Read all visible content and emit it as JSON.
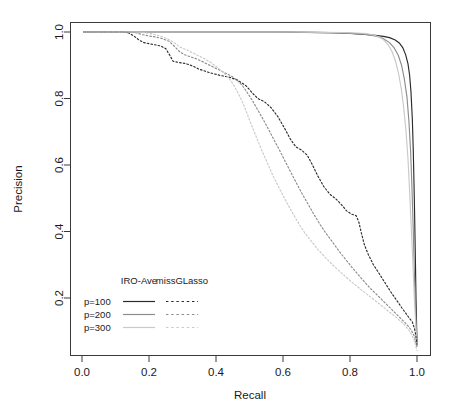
{
  "chart_data": {
    "type": "line",
    "title": "",
    "xlabel": "Recall",
    "ylabel": "Precision",
    "xlim": [
      0.0,
      1.0
    ],
    "ylim": [
      0.0,
      1.02
    ],
    "xticks": [
      "0.0",
      "0.2",
      "0.4",
      "0.6",
      "0.8",
      "1.0"
    ],
    "xtick_values": [
      0.0,
      0.2,
      0.4,
      0.6,
      0.8,
      1.0
    ],
    "yticks": [
      "0.2",
      "0.4",
      "0.6",
      "0.8",
      "1.0"
    ],
    "ytick_values": [
      0.2,
      0.4,
      0.6,
      0.8,
      1.0
    ],
    "grid": false,
    "legend_position": "lower-left-inside",
    "legend": {
      "col_headers": [
        "IRO-Ave",
        "missGLasso"
      ],
      "row_labels": [
        "p=100",
        "p=200",
        "p=300"
      ],
      "line_styles": {
        "IRO-Ave": "solid",
        "missGLasso": "dashed"
      },
      "row_colors": [
        "#2b2b2b",
        "#8c8c8c",
        "#c9c9c9"
      ]
    },
    "series": [
      {
        "name": "IRO-Ave p=100",
        "method": "IRO-Ave",
        "p": 100,
        "style": "solid",
        "color": "#2b2b2b",
        "points": [
          [
            0.005,
            1.0
          ],
          [
            0.1,
            1.0
          ],
          [
            0.2,
            1.0
          ],
          [
            0.3,
            1.0
          ],
          [
            0.4,
            1.0
          ],
          [
            0.5,
            1.0
          ],
          [
            0.6,
            1.0
          ],
          [
            0.68,
            0.999
          ],
          [
            0.74,
            0.998
          ],
          [
            0.8,
            0.996
          ],
          [
            0.845,
            0.993
          ],
          [
            0.875,
            0.99
          ],
          [
            0.9,
            0.987
          ],
          [
            0.918,
            0.983
          ],
          [
            0.935,
            0.976
          ],
          [
            0.948,
            0.966
          ],
          [
            0.958,
            0.952
          ],
          [
            0.966,
            0.932
          ],
          [
            0.973,
            0.905
          ],
          [
            0.978,
            0.87
          ],
          [
            0.982,
            0.82
          ],
          [
            0.986,
            0.74
          ],
          [
            0.989,
            0.64
          ],
          [
            0.992,
            0.5
          ],
          [
            0.995,
            0.33
          ],
          [
            0.997,
            0.2
          ],
          [
            0.999,
            0.11
          ],
          [
            1.0,
            0.065
          ]
        ]
      },
      {
        "name": "IRO-Ave p=200",
        "method": "IRO-Ave",
        "p": 200,
        "style": "solid",
        "color": "#8c8c8c",
        "points": [
          [
            0.005,
            1.0
          ],
          [
            0.15,
            1.0
          ],
          [
            0.3,
            1.0
          ],
          [
            0.45,
            1.0
          ],
          [
            0.58,
            1.0
          ],
          [
            0.66,
            0.999
          ],
          [
            0.72,
            0.998
          ],
          [
            0.78,
            0.997
          ],
          [
            0.82,
            0.995
          ],
          [
            0.855,
            0.992
          ],
          [
            0.88,
            0.987
          ],
          [
            0.9,
            0.98
          ],
          [
            0.918,
            0.968
          ],
          [
            0.932,
            0.952
          ],
          [
            0.944,
            0.93
          ],
          [
            0.954,
            0.9
          ],
          [
            0.962,
            0.86
          ],
          [
            0.97,
            0.805
          ],
          [
            0.976,
            0.73
          ],
          [
            0.981,
            0.64
          ],
          [
            0.985,
            0.53
          ],
          [
            0.989,
            0.4
          ],
          [
            0.992,
            0.28
          ],
          [
            0.995,
            0.18
          ],
          [
            0.998,
            0.11
          ],
          [
            1.0,
            0.065
          ]
        ]
      },
      {
        "name": "IRO-Ave p=300",
        "method": "IRO-Ave",
        "p": 300,
        "style": "solid",
        "color": "#c9c9c9",
        "points": [
          [
            0.005,
            1.0
          ],
          [
            0.2,
            1.0
          ],
          [
            0.4,
            1.0
          ],
          [
            0.55,
            1.0
          ],
          [
            0.65,
            1.0
          ],
          [
            0.72,
            0.999
          ],
          [
            0.78,
            0.998
          ],
          [
            0.82,
            0.997
          ],
          [
            0.85,
            0.995
          ],
          [
            0.87,
            0.991
          ],
          [
            0.888,
            0.985
          ],
          [
            0.902,
            0.975
          ],
          [
            0.915,
            0.96
          ],
          [
            0.926,
            0.94
          ],
          [
            0.936,
            0.912
          ],
          [
            0.945,
            0.875
          ],
          [
            0.953,
            0.83
          ],
          [
            0.96,
            0.775
          ],
          [
            0.967,
            0.705
          ],
          [
            0.973,
            0.62
          ],
          [
            0.978,
            0.52
          ],
          [
            0.983,
            0.41
          ],
          [
            0.988,
            0.3
          ],
          [
            0.992,
            0.2
          ],
          [
            0.996,
            0.125
          ],
          [
            1.0,
            0.055
          ]
        ]
      },
      {
        "name": "missGLasso p=100",
        "method": "missGLasso",
        "p": 100,
        "style": "dashed",
        "color": "#2b2b2b",
        "points": [
          [
            0.005,
            1.0
          ],
          [
            0.08,
            1.0
          ],
          [
            0.125,
            1.0
          ],
          [
            0.14,
            0.997
          ],
          [
            0.155,
            0.988
          ],
          [
            0.17,
            0.976
          ],
          [
            0.185,
            0.968
          ],
          [
            0.2,
            0.965
          ],
          [
            0.215,
            0.962
          ],
          [
            0.235,
            0.958
          ],
          [
            0.25,
            0.95
          ],
          [
            0.262,
            0.93
          ],
          [
            0.272,
            0.912
          ],
          [
            0.29,
            0.908
          ],
          [
            0.31,
            0.905
          ],
          [
            0.33,
            0.898
          ],
          [
            0.35,
            0.888
          ],
          [
            0.38,
            0.878
          ],
          [
            0.41,
            0.87
          ],
          [
            0.44,
            0.864
          ],
          [
            0.465,
            0.855
          ],
          [
            0.49,
            0.838
          ],
          [
            0.51,
            0.815
          ],
          [
            0.525,
            0.8
          ],
          [
            0.545,
            0.79
          ],
          [
            0.565,
            0.772
          ],
          [
            0.585,
            0.745
          ],
          [
            0.605,
            0.71
          ],
          [
            0.622,
            0.678
          ],
          [
            0.638,
            0.655
          ],
          [
            0.655,
            0.645
          ],
          [
            0.672,
            0.63
          ],
          [
            0.688,
            0.6
          ],
          [
            0.705,
            0.565
          ],
          [
            0.722,
            0.535
          ],
          [
            0.74,
            0.512
          ],
          [
            0.758,
            0.498
          ],
          [
            0.775,
            0.48
          ],
          [
            0.79,
            0.462
          ],
          [
            0.805,
            0.452
          ],
          [
            0.818,
            0.448
          ],
          [
            0.826,
            0.43
          ],
          [
            0.834,
            0.395
          ],
          [
            0.843,
            0.36
          ],
          [
            0.855,
            0.33
          ],
          [
            0.87,
            0.3
          ],
          [
            0.888,
            0.272
          ],
          [
            0.905,
            0.245
          ],
          [
            0.922,
            0.218
          ],
          [
            0.94,
            0.192
          ],
          [
            0.955,
            0.17
          ],
          [
            0.968,
            0.152
          ],
          [
            0.978,
            0.138
          ],
          [
            0.986,
            0.128
          ],
          [
            0.992,
            0.11
          ],
          [
            0.996,
            0.09
          ],
          [
            1.0,
            0.06
          ]
        ]
      },
      {
        "name": "missGLasso p=200",
        "method": "missGLasso",
        "p": 200,
        "style": "dashed",
        "color": "#8c8c8c",
        "points": [
          [
            0.005,
            1.0
          ],
          [
            0.1,
            1.0
          ],
          [
            0.14,
            1.0
          ],
          [
            0.16,
            0.998
          ],
          [
            0.18,
            0.992
          ],
          [
            0.2,
            0.988
          ],
          [
            0.22,
            0.985
          ],
          [
            0.24,
            0.98
          ],
          [
            0.26,
            0.972
          ],
          [
            0.275,
            0.958
          ],
          [
            0.29,
            0.942
          ],
          [
            0.305,
            0.932
          ],
          [
            0.325,
            0.925
          ],
          [
            0.345,
            0.918
          ],
          [
            0.365,
            0.908
          ],
          [
            0.385,
            0.898
          ],
          [
            0.405,
            0.888
          ],
          [
            0.425,
            0.878
          ],
          [
            0.445,
            0.868
          ],
          [
            0.462,
            0.856
          ],
          [
            0.478,
            0.84
          ],
          [
            0.492,
            0.82
          ],
          [
            0.508,
            0.795
          ],
          [
            0.525,
            0.765
          ],
          [
            0.542,
            0.735
          ],
          [
            0.558,
            0.705
          ],
          [
            0.575,
            0.672
          ],
          [
            0.592,
            0.64
          ],
          [
            0.608,
            0.608
          ],
          [
            0.625,
            0.575
          ],
          [
            0.642,
            0.542
          ],
          [
            0.658,
            0.512
          ],
          [
            0.675,
            0.482
          ],
          [
            0.692,
            0.452
          ],
          [
            0.71,
            0.422
          ],
          [
            0.728,
            0.395
          ],
          [
            0.748,
            0.368
          ],
          [
            0.768,
            0.34
          ],
          [
            0.79,
            0.312
          ],
          [
            0.812,
            0.285
          ],
          [
            0.835,
            0.258
          ],
          [
            0.858,
            0.232
          ],
          [
            0.882,
            0.208
          ],
          [
            0.905,
            0.185
          ],
          [
            0.928,
            0.162
          ],
          [
            0.95,
            0.14
          ],
          [
            0.968,
            0.122
          ],
          [
            0.982,
            0.105
          ],
          [
            0.992,
            0.085
          ],
          [
            1.0,
            0.052
          ]
        ]
      },
      {
        "name": "missGLasso p=300",
        "method": "missGLasso",
        "p": 300,
        "style": "dashed",
        "color": "#c9c9c9",
        "points": [
          [
            0.005,
            1.0
          ],
          [
            0.12,
            1.0
          ],
          [
            0.16,
            1.0
          ],
          [
            0.185,
            0.998
          ],
          [
            0.205,
            0.995
          ],
          [
            0.225,
            0.99
          ],
          [
            0.245,
            0.984
          ],
          [
            0.262,
            0.976
          ],
          [
            0.278,
            0.966
          ],
          [
            0.292,
            0.955
          ],
          [
            0.308,
            0.948
          ],
          [
            0.325,
            0.94
          ],
          [
            0.345,
            0.93
          ],
          [
            0.365,
            0.92
          ],
          [
            0.385,
            0.908
          ],
          [
            0.402,
            0.895
          ],
          [
            0.42,
            0.88
          ],
          [
            0.438,
            0.862
          ],
          [
            0.452,
            0.842
          ],
          [
            0.465,
            0.818
          ],
          [
            0.478,
            0.792
          ],
          [
            0.49,
            0.762
          ],
          [
            0.502,
            0.73
          ],
          [
            0.515,
            0.698
          ],
          [
            0.528,
            0.665
          ],
          [
            0.542,
            0.632
          ],
          [
            0.556,
            0.6
          ],
          [
            0.57,
            0.568
          ],
          [
            0.585,
            0.538
          ],
          [
            0.6,
            0.508
          ],
          [
            0.616,
            0.478
          ],
          [
            0.632,
            0.45
          ],
          [
            0.648,
            0.422
          ],
          [
            0.665,
            0.396
          ],
          [
            0.685,
            0.37
          ],
          [
            0.705,
            0.345
          ],
          [
            0.728,
            0.32
          ],
          [
            0.752,
            0.296
          ],
          [
            0.778,
            0.272
          ],
          [
            0.805,
            0.248
          ],
          [
            0.832,
            0.226
          ],
          [
            0.86,
            0.204
          ],
          [
            0.888,
            0.182
          ],
          [
            0.915,
            0.16
          ],
          [
            0.94,
            0.14
          ],
          [
            0.962,
            0.12
          ],
          [
            0.98,
            0.098
          ],
          [
            0.992,
            0.072
          ],
          [
            1.0,
            0.042
          ]
        ]
      }
    ]
  }
}
